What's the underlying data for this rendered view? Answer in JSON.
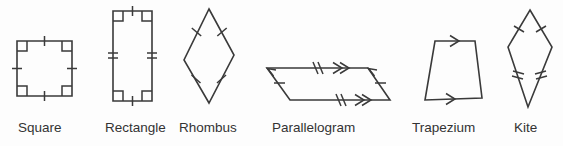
{
  "figure": {
    "background_color": "#fdfdfd",
    "stroke_color": "#3a3a3a",
    "label_color": "#333333"
  },
  "shapes": [
    {
      "name": "square",
      "label": "Square",
      "label_x": 18,
      "label_y": 120,
      "vertices": "17,41 72,41 72,96 17,96",
      "side_ticks": [
        1,
        1,
        1,
        1
      ],
      "right_angle_marks": 4,
      "arrows": 0
    },
    {
      "name": "rectangle",
      "label": "Rectangle",
      "label_x": 105,
      "label_y": 120,
      "vertices": "113,11 152,11 152,101 113,101",
      "side_ticks": [
        1,
        2,
        1,
        2
      ],
      "right_angle_marks": 4,
      "arrows": 0
    },
    {
      "name": "rhombus",
      "label": "Rhombus",
      "label_x": 179,
      "label_y": 120,
      "vertices": "209,9 234,55 209,103 184,60",
      "side_ticks": [
        1,
        1,
        1,
        1
      ],
      "right_angle_marks": 0,
      "arrows": 0
    },
    {
      "name": "parallelogram",
      "label": "Parallelogram",
      "label_x": 272,
      "label_y": 120,
      "vertices": "267,68 368,68 390,100 290,100",
      "side_ticks": [
        2,
        1,
        2,
        1
      ],
      "right_angle_marks": 0,
      "arrows": 4
    },
    {
      "name": "trapezium",
      "label": "Trapezium",
      "label_x": 412,
      "label_y": 120,
      "vertices": "435,41 475,41 482,98 425,100",
      "side_ticks": [
        0,
        0,
        0,
        0
      ],
      "right_angle_marks": 0,
      "arrows": 2
    },
    {
      "name": "kite",
      "label": "Kite",
      "label_x": 514,
      "label_y": 120,
      "vertices": "530,10 552,47 528,107 508,47",
      "side_ticks": [
        1,
        2,
        2,
        1
      ],
      "right_angle_marks": 0,
      "arrows": 0
    }
  ]
}
